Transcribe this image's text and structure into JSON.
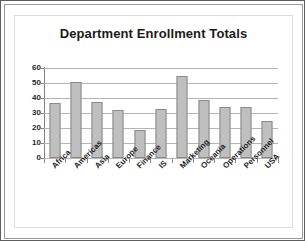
{
  "chart_data": {
    "type": "bar",
    "title": "Department Enrollment Totals",
    "xlabel": "",
    "ylabel": "",
    "categories": [
      "Africa",
      "Americas",
      "Asia",
      "Europe",
      "Finance",
      "IS",
      "Marketing",
      "Oceania",
      "Operations",
      "Personnel",
      "USA"
    ],
    "values": [
      37,
      51,
      37.5,
      32,
      19,
      32.5,
      55,
      39,
      34,
      34,
      25
    ],
    "ylim": [
      0,
      60
    ],
    "yticks": [
      0,
      10,
      20,
      30,
      40,
      50,
      60
    ],
    "ytick_labels": [
      "0",
      "10",
      "20",
      "30",
      "40",
      "50",
      "60"
    ],
    "grid": true,
    "legend": false,
    "legend_position": "none",
    "series": [
      {
        "name": "Enrollment Totals",
        "values": [
          37,
          51,
          37.5,
          32,
          19,
          32.5,
          55,
          39,
          34,
          34,
          25
        ]
      }
    ]
  },
  "style": {
    "bar_fill": "#bfbfbf",
    "bar_stroke": "#8a8a8a",
    "gridline_color": "#b4b4b4",
    "axis_color": "#808080",
    "text_color": "#1f1f1f",
    "background": "#ffffff",
    "frame_color": "#5e5e5e"
  }
}
